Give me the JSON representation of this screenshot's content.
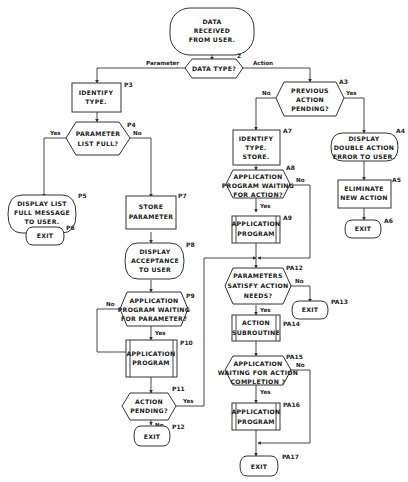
{
  "diagram": {
    "type": "flowchart",
    "nodes": {
      "start": {
        "ref": "",
        "lines": [
          "DATA",
          "RECEIVED",
          "FROM USER."
        ],
        "shape": "terminal"
      },
      "n2": {
        "ref": "2",
        "lines": [
          "DATA  TYPE?"
        ],
        "shape": "decision"
      },
      "p3": {
        "ref": "P3",
        "lines": [
          "IDENTIFY",
          "TYPE."
        ],
        "shape": "process"
      },
      "p4": {
        "ref": "P4",
        "lines": [
          "PARAMETER",
          "LIST  FULL?"
        ],
        "shape": "decision"
      },
      "p5": {
        "ref": "P5",
        "lines": [
          "DISPLAY  LIST",
          "FULL MESSAGE",
          "TO  USER."
        ],
        "shape": "terminal"
      },
      "p6": {
        "ref": "P6",
        "lines": [
          "EXIT"
        ],
        "shape": "terminal"
      },
      "p7": {
        "ref": "P7",
        "lines": [
          "STORE",
          "PARAMETER"
        ],
        "shape": "process"
      },
      "p8": {
        "ref": "P8",
        "lines": [
          "DISPLAY",
          "ACCEPTANCE",
          "TO USER"
        ],
        "shape": "terminal"
      },
      "p9": {
        "ref": "P9",
        "lines": [
          "APPLICATION",
          "PROGRAM WAITING",
          "FOR PARAMETER?"
        ],
        "shape": "decision"
      },
      "p10": {
        "ref": "P10",
        "lines": [
          "APPLICATION",
          "PROGRAM"
        ],
        "shape": "predefined"
      },
      "p11": {
        "ref": "P11",
        "lines": [
          "ACTION",
          "PENDING?"
        ],
        "shape": "decision"
      },
      "p12": {
        "ref": "P12",
        "lines": [
          "EXIT"
        ],
        "shape": "terminal"
      },
      "a3": {
        "ref": "A3",
        "lines": [
          "PREVIOUS",
          "ACTION",
          "PENDING?"
        ],
        "shape": "decision"
      },
      "a4": {
        "ref": "A4",
        "lines": [
          "DISPLAY",
          "DOUBLE  ACTION",
          "ERROR TO USER."
        ],
        "shape": "terminal"
      },
      "a5": {
        "ref": "A5",
        "lines": [
          "ELIMINATE",
          "NEW ACTION"
        ],
        "shape": "process"
      },
      "a6": {
        "ref": "A6",
        "lines": [
          "EXIT"
        ],
        "shape": "terminal"
      },
      "a7": {
        "ref": "A7",
        "lines": [
          "IDENTIFY",
          "TYPE.",
          "STORE."
        ],
        "shape": "process"
      },
      "a8": {
        "ref": "A8",
        "lines": [
          "APPLICATION",
          "PROGRAM  WAITING",
          "FOR ACTION?"
        ],
        "shape": "decision"
      },
      "a9": {
        "ref": "A9",
        "lines": [
          "APPLICATION",
          "PROGRAM"
        ],
        "shape": "predefined"
      },
      "pa12": {
        "ref": "PA12",
        "lines": [
          "PARAMETERS",
          "SATISFY  ACTION",
          "NEEDS?"
        ],
        "shape": "decision"
      },
      "pa13": {
        "ref": "PA13",
        "lines": [
          "EXIT"
        ],
        "shape": "terminal"
      },
      "pa14": {
        "ref": "PA14",
        "lines": [
          "ACTION",
          "SUBROUTINE"
        ],
        "shape": "predefined"
      },
      "pa15": {
        "ref": "PA15",
        "lines": [
          "APPLICATION",
          "WAITING FOR ACTION",
          "COMPLETION ?"
        ],
        "shape": "decision"
      },
      "pa16": {
        "ref": "PA16",
        "lines": [
          "APPLICATION",
          "PROGRAM"
        ],
        "shape": "predefined"
      },
      "pa17": {
        "ref": "PA17",
        "lines": [
          "EXIT"
        ],
        "shape": "terminal"
      }
    },
    "edge_labels": {
      "parameter": "Parameter",
      "action": "Action",
      "p4_yes": "Yes",
      "p4_no": "No",
      "p9_no": "No",
      "p9_yes": "Yes",
      "p11_yes": "Yes",
      "p11_no": "No",
      "a3_no": "No",
      "a3_yes": "Yes",
      "a8_no": "No",
      "a8_yes": "Yes",
      "pa12_no": "No",
      "pa12_yes": "Yes",
      "pa15_no": "No",
      "pa15_yes": "Yes"
    },
    "edges": [
      {
        "from": "start",
        "to": "n2"
      },
      {
        "from": "n2",
        "to": "p3",
        "label": "Parameter"
      },
      {
        "from": "n2",
        "to": "a3",
        "label": "Action"
      },
      {
        "from": "p3",
        "to": "p4"
      },
      {
        "from": "p4",
        "to": "p5",
        "label": "Yes"
      },
      {
        "from": "p4",
        "to": "p7",
        "label": "No"
      },
      {
        "from": "p5",
        "to": "p6"
      },
      {
        "from": "p7",
        "to": "p8"
      },
      {
        "from": "p8",
        "to": "p9"
      },
      {
        "from": "p9",
        "to": "p10",
        "label": "Yes"
      },
      {
        "from": "p9",
        "to": "p11",
        "label": "No"
      },
      {
        "from": "p10",
        "to": "p11"
      },
      {
        "from": "p11",
        "to": "p12",
        "label": "No"
      },
      {
        "from": "p11",
        "to": "pa12",
        "label": "Yes"
      },
      {
        "from": "a3",
        "to": "a7",
        "label": "No"
      },
      {
        "from": "a3",
        "to": "a4",
        "label": "Yes"
      },
      {
        "from": "a4",
        "to": "a5"
      },
      {
        "from": "a5",
        "to": "a6"
      },
      {
        "from": "a7",
        "to": "a8"
      },
      {
        "from": "a8",
        "to": "a9",
        "label": "Yes"
      },
      {
        "from": "a8",
        "to": "pa12",
        "label": "No"
      },
      {
        "from": "a9",
        "to": "pa12"
      },
      {
        "from": "pa12",
        "to": "pa13",
        "label": "No"
      },
      {
        "from": "pa12",
        "to": "pa14",
        "label": "Yes"
      },
      {
        "from": "pa14",
        "to": "pa15"
      },
      {
        "from": "pa15",
        "to": "pa16",
        "label": "Yes"
      },
      {
        "from": "pa15",
        "to": "pa17",
        "label": "No"
      },
      {
        "from": "pa16",
        "to": "pa17"
      }
    ]
  }
}
